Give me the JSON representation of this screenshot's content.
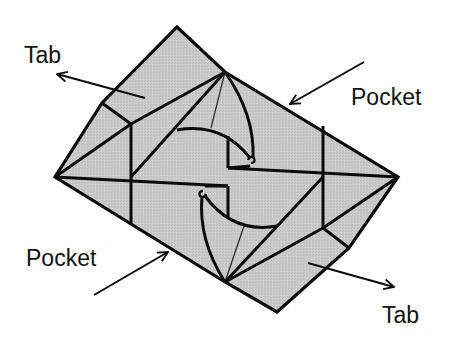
{
  "diagram": {
    "colors": {
      "paper_fill": "#c8c8c8",
      "line": "#0a0a0a",
      "background": "#ffffff"
    },
    "labels": {
      "tab_top_left": "Tab",
      "pocket_top_right": "Pocket",
      "pocket_bottom_left": "Pocket",
      "tab_bottom_right": "Tab"
    }
  }
}
